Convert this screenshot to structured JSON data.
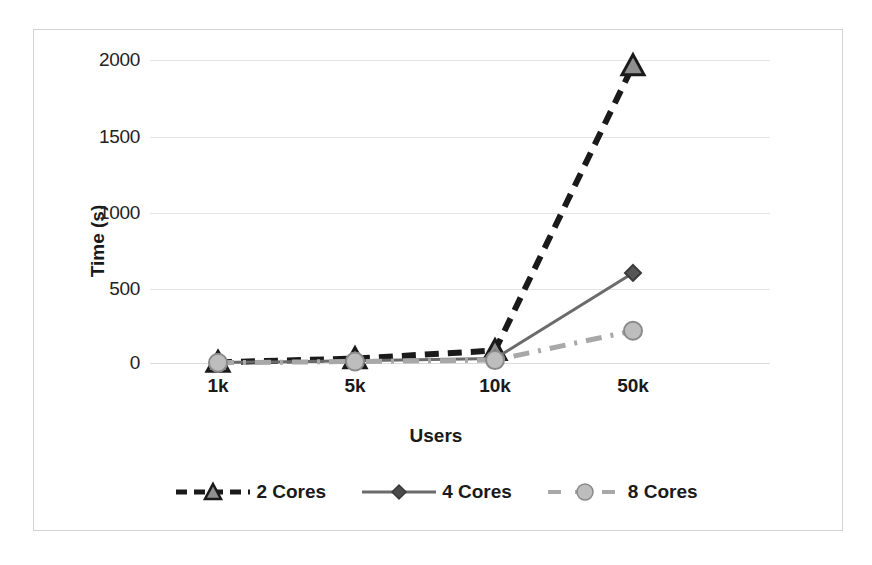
{
  "chart_data": {
    "type": "line",
    "title": "",
    "xlabel": "Users",
    "ylabel": "Time (s)",
    "categories": [
      "1k",
      "5k",
      "10k",
      "50k"
    ],
    "ylim": [
      0,
      2150
    ],
    "yticks": [
      0,
      500,
      1000,
      1500,
      2000
    ],
    "ytick_labels": [
      "0",
      "500",
      "1000",
      "1500",
      "2000"
    ],
    "grid": "horizontal",
    "legend_position": "bottom",
    "series": [
      {
        "name": "2 Cores",
        "values": [
          5,
          30,
          85,
          2030
        ],
        "color": "#1a1a1a",
        "line_style": "dashed",
        "marker": "triangle"
      },
      {
        "name": "4 Cores",
        "values": [
          3,
          15,
          30,
          615
        ],
        "color": "#6b6b6b",
        "line_style": "solid",
        "marker": "diamond"
      },
      {
        "name": "8 Cores",
        "values": [
          2,
          10,
          20,
          220
        ],
        "color": "#a8a8a8",
        "line_style": "dash-dot",
        "marker": "circle"
      }
    ]
  },
  "axis": {
    "y_title": "Time (s)",
    "x_title": "Users",
    "ytick_0": "0",
    "ytick_1": "500",
    "ytick_2": "1000",
    "ytick_3": "1500",
    "ytick_4": "2000",
    "xtick_0": "1k",
    "xtick_1": "5k",
    "xtick_2": "10k",
    "xtick_3": "50k"
  },
  "legend": {
    "items": [
      {
        "label": "2 Cores"
      },
      {
        "label": "4 Cores"
      },
      {
        "label": "8 Cores"
      }
    ]
  },
  "colors": {
    "series_2_cores": "#1a1a1a",
    "series_4_cores": "#6b6b6b",
    "series_8_cores": "#a8a8a8",
    "gridline": "#e4e4e4",
    "frame": "#d2d2d2",
    "background": "#ffffff"
  }
}
